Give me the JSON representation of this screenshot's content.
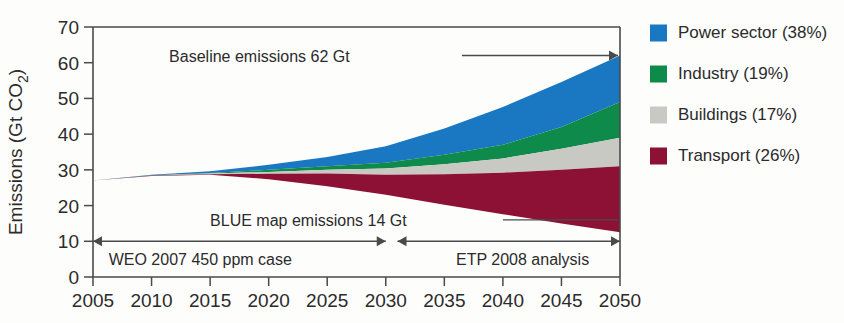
{
  "chart_data": {
    "type": "area",
    "stacked": true,
    "title": "",
    "xlabel": "",
    "ylabel": "Emissions (Gt CO2)",
    "ylabel_main": "Emissions (Gt CO",
    "ylabel_sub": "2",
    "ylabel_close": ")",
    "xlim": [
      2005,
      2050
    ],
    "ylim": [
      0,
      70
    ],
    "grid": false,
    "legend_position": "right",
    "x": [
      2005,
      2010,
      2015,
      2020,
      2025,
      2030,
      2035,
      2040,
      2045,
      2050
    ],
    "xticks": [
      "2005",
      "2010",
      "2015",
      "2020",
      "2025",
      "2030",
      "2035",
      "2040",
      "2045",
      "2050"
    ],
    "yticks": [
      "0",
      "10",
      "20",
      "30",
      "40",
      "50",
      "60",
      "70"
    ],
    "baseline_line": [
      27.0,
      28.6,
      29.6,
      31.4,
      33.6,
      36.6,
      41.6,
      47.6,
      54.6,
      62.0
    ],
    "blue_map_line": [
      27.0,
      28.3,
      28.6,
      27.4,
      25.4,
      23.0,
      20.2,
      17.6,
      15.0,
      12.5
    ],
    "series": [
      {
        "name": "Power sector",
        "share_label": "(38%)",
        "color": "#1a78c2",
        "cumulative_top": [
          27.0,
          28.6,
          29.6,
          31.4,
          33.6,
          36.6,
          41.6,
          47.6,
          54.6,
          62.0
        ],
        "cumulative_bottom": [
          27.0,
          28.5,
          29.1,
          30.0,
          31.0,
          32.0,
          34.2,
          37.0,
          42.0,
          49.0
        ]
      },
      {
        "name": "Industry",
        "share_label": "(19%)",
        "color": "#0e8a4a",
        "cumulative_top": [
          27.0,
          28.5,
          29.1,
          30.0,
          31.0,
          32.0,
          34.2,
          37.0,
          42.0,
          49.0
        ],
        "cumulative_bottom": [
          27.0,
          28.45,
          28.95,
          29.4,
          30.0,
          30.4,
          31.6,
          33.2,
          35.9,
          39.0
        ]
      },
      {
        "name": "Buildings",
        "share_label": "(17%)",
        "color": "#c9c9c4",
        "cumulative_top": [
          27.0,
          28.45,
          28.95,
          29.4,
          30.0,
          30.4,
          31.6,
          33.2,
          35.9,
          39.0
        ],
        "cumulative_bottom": [
          27.0,
          28.4,
          28.8,
          28.9,
          29.0,
          28.6,
          28.8,
          29.2,
          30.0,
          31.0
        ]
      },
      {
        "name": "Transport",
        "share_label": "(26%)",
        "color": "#8c1134",
        "cumulative_top": [
          27.0,
          28.4,
          28.8,
          28.9,
          29.0,
          28.6,
          28.8,
          29.2,
          30.0,
          31.0
        ],
        "cumulative_bottom": [
          27.0,
          28.3,
          28.6,
          27.4,
          25.4,
          23.0,
          20.2,
          17.6,
          15.0,
          12.5
        ]
      }
    ],
    "annotations": [
      {
        "name": "baseline-emissions",
        "text": "Baseline emissions 62 Gt",
        "x_value": 2030,
        "y_value": 62
      },
      {
        "name": "blue-map-emissions",
        "text": "BLUE map emissions 14 Gt",
        "x_value": 2027,
        "y_value": 16
      },
      {
        "name": "weo-case",
        "text": "WEO 2007 450 ppm case",
        "x_value": 2006,
        "y_value": 5
      },
      {
        "name": "etp-analysis",
        "text": "ETP 2008 analysis",
        "x_value": 2036,
        "y_value": 5
      }
    ],
    "span_arrows": [
      {
        "name": "weo-span",
        "from": 2005,
        "to": 2030,
        "y_value": 10
      },
      {
        "name": "etp-span",
        "from": 2031,
        "to": 2050,
        "y_value": 10
      }
    ]
  },
  "legend": {
    "items": [
      {
        "label": "Power sector (38%)",
        "color": "#1a78c2",
        "swatch_name": "legend-swatch-power-sector"
      },
      {
        "label": "Industry (19%)",
        "color": "#0e8a4a",
        "swatch_name": "legend-swatch-industry"
      },
      {
        "label": "Buildings (17%)",
        "color": "#c9c9c4",
        "swatch_name": "legend-swatch-buildings"
      },
      {
        "label": "Transport (26%)",
        "color": "#8c1134",
        "swatch_name": "legend-swatch-transport"
      }
    ]
  }
}
